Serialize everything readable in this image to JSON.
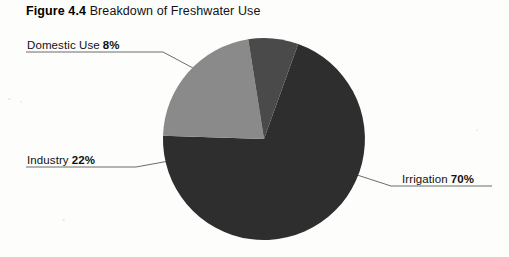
{
  "caption": {
    "figure_label": "Figure 4.4",
    "title": "Breakdown of Freshwater Use"
  },
  "chart_data": {
    "type": "pie",
    "title": "Breakdown of Freshwater Use",
    "categories": [
      "Irrigation",
      "Industry",
      "Domestic Use"
    ],
    "values": [
      70,
      22,
      8
    ],
    "unit": "%",
    "labels": [
      "Irrigation 70%",
      "Industry 22%",
      "Domestic Use 8%"
    ],
    "legend": "none",
    "grid": false,
    "colors": [
      "#2e2e2e",
      "#8a8a8a",
      "#4a4a4a"
    ],
    "slices": [
      {
        "name": "Irrigation",
        "value": 70,
        "display": "70%",
        "color": "#2e2e2e"
      },
      {
        "name": "Industry",
        "value": 22,
        "display": "22%",
        "color": "#8a8a8a"
      },
      {
        "name": "Domestic Use",
        "value": 8,
        "display": "8%",
        "color": "#4a4a4a"
      }
    ]
  },
  "callouts": {
    "domestic": {
      "category": "Domestic Use",
      "percent": "8%"
    },
    "industry": {
      "category": "Industry",
      "percent": "22%"
    },
    "irrigation": {
      "category": "Irrigation",
      "percent": "70%"
    }
  },
  "colors": {
    "irrigation": "#2e2e2e",
    "industry": "#8a8a8a",
    "domestic": "#4a4a4a",
    "leader_line": "#5a5a5a",
    "background": "#fdfdfc"
  }
}
